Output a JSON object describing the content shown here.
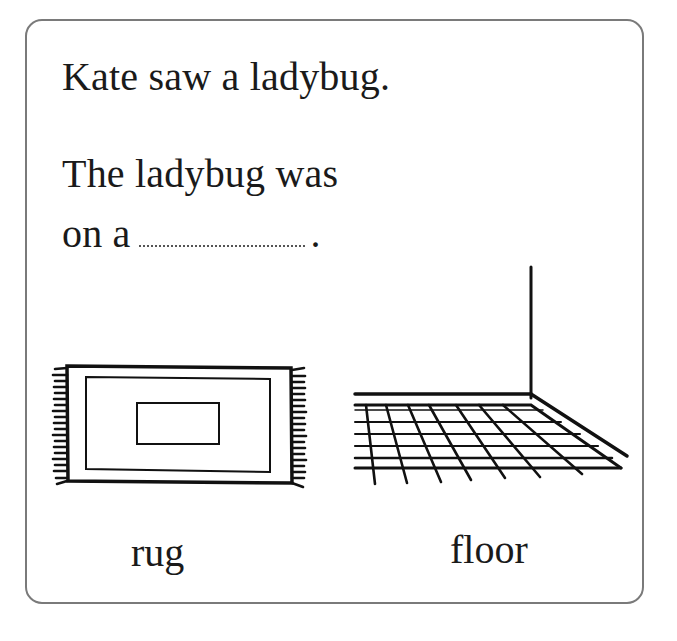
{
  "worksheet": {
    "sentence_1": "Kate saw a ladybug.",
    "sentence_2_line_1": "The ladybug was",
    "sentence_2_line_2_prefix": "on a",
    "sentence_2_blank": "",
    "sentence_2_suffix": ".",
    "options": [
      {
        "label": "rug",
        "picture": "rug-picture"
      },
      {
        "label": "floor",
        "picture": "floor-picture"
      }
    ]
  },
  "colors": {
    "border": "#7a7a7a",
    "ink": "#1a1a1a",
    "background": "#ffffff"
  }
}
